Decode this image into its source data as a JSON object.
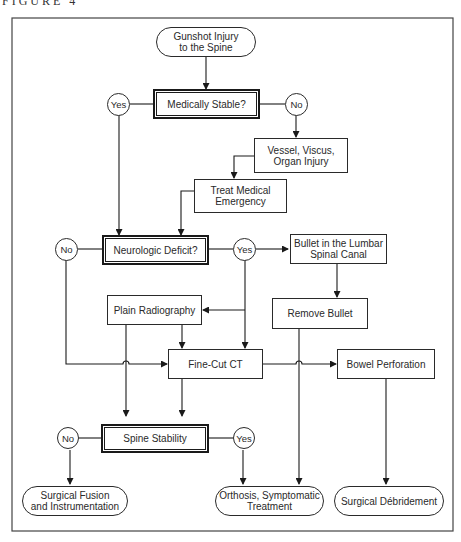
{
  "figure": {
    "label": "FIGURE 4",
    "type": "flowchart"
  },
  "nodes": {
    "start": "Gunshot Injury\nto the Spine",
    "medically_stable": "Medically Stable?",
    "ms_yes": "Yes",
    "ms_no": "No",
    "vessel": "Vessel, Viscus,\nOrgan Injury",
    "treat": "Treat Medical\nEmergency",
    "neuro": "Neurologic Deficit?",
    "nd_no": "No",
    "nd_yes": "Yes",
    "bullet_lumbar": "Bullet in the Lumbar\nSpinal Canal",
    "plain_radiography": "Plain Radiography",
    "remove_bullet": "Remove Bullet",
    "fine_cut_ct": "Fine-Cut CT",
    "bowel": "Bowel Perforation",
    "spine_stability": "Spine Stability",
    "ss_no": "No",
    "ss_yes": "Yes",
    "fusion": "Surgical Fusion\nand Instrumentation",
    "orthosis": "Orthosis, Symptomatic\nTreatment",
    "debridement": "Surgical Débridement"
  },
  "colors": {
    "line": "#1a1a1a",
    "background": "#ffffff"
  }
}
